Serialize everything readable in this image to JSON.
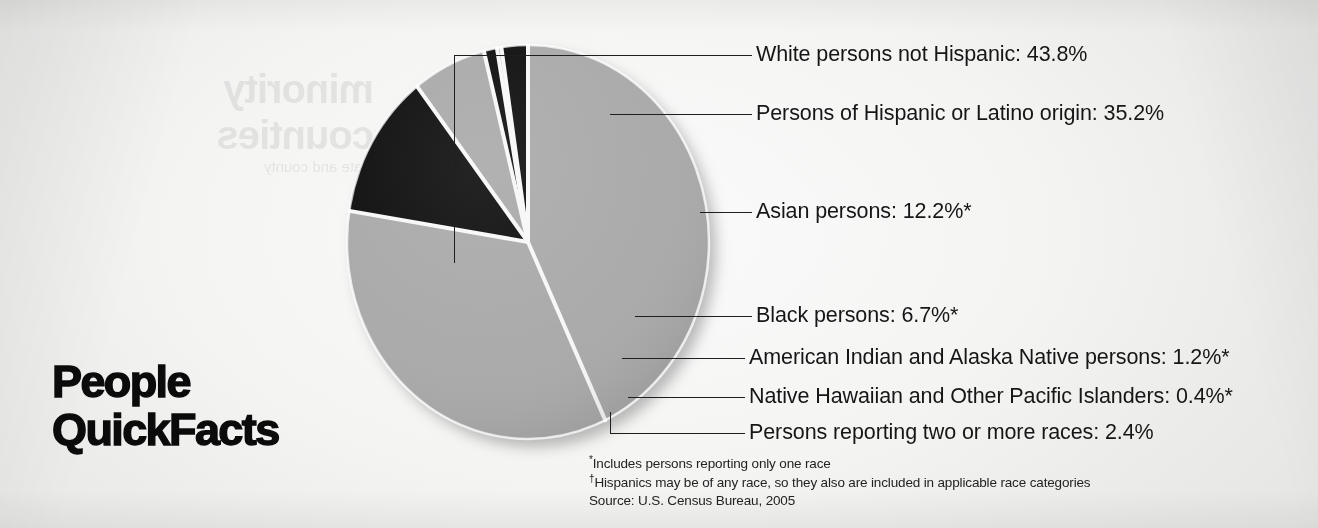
{
  "title": {
    "line1": "People",
    "line2": "QuickFacts"
  },
  "showthrough": {
    "line1": "minority",
    "line2": "counties",
    "body": "state and county"
  },
  "chart_data": {
    "type": "pie",
    "title": "People QuickFacts",
    "source": "Source: U.S. Census Bureau, 2005",
    "legend_position": "right-callouts",
    "categories": [
      "White persons not Hispanic",
      "Persons of Hispanic or Latino origin",
      "Asian persons",
      "Black persons",
      "American Indian and Alaska Native persons",
      "Native Hawaiian and Other Pacific Islanders",
      "Persons reporting two or more races"
    ],
    "values": [
      43.8,
      35.2,
      12.2,
      6.7,
      1.2,
      0.4,
      2.4
    ],
    "value_labels": [
      "43.8%",
      "35.2%",
      "12.2%",
      "6.7%",
      "1.2%",
      "0.4%",
      "2.4%"
    ],
    "colors": [
      "#a9a9a9",
      "#a9a9a9",
      "#111111",
      "#a9a9a9",
      "#111111",
      "#a9a9a9",
      "#111111"
    ],
    "footnote_markers": [
      "",
      "†",
      "*",
      "*",
      "*",
      "*",
      ""
    ]
  },
  "callouts": [
    {
      "name": "white",
      "text": "White persons not Hispanic: 43.8%",
      "marker": ""
    },
    {
      "name": "hispanic",
      "text": "Persons of Hispanic or Latino origin: 35.2%",
      "marker": "†"
    },
    {
      "name": "asian",
      "text": "Asian persons: 12.2%*",
      "marker": ""
    },
    {
      "name": "black",
      "text": "Black persons: 6.7%*",
      "marker": ""
    },
    {
      "name": "aian",
      "text": "American Indian and Alaska Native persons: 1.2%*",
      "marker": ""
    },
    {
      "name": "nhpi",
      "text": "Native Hawaiian and Other Pacific Islanders: 0.4%*",
      "marker": ""
    },
    {
      "name": "twoplus",
      "text": "Persons reporting two or more races: 2.4%",
      "marker": ""
    }
  ],
  "notes": {
    "marker1": "*",
    "note1": "Includes persons reporting only one race",
    "marker2": "†",
    "note2": "Hispanics may be of any race, so they also are included in applicable race categories",
    "source": "Source: U.S. Census Bureau, 2005"
  },
  "colors": {
    "slice_gray": "#a9a9a9",
    "slice_black": "#111111",
    "separator": "#f7f7f7",
    "text": "#161616",
    "page": "#f4f4f3"
  }
}
